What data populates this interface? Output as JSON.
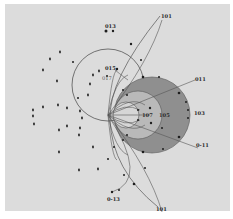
{
  "figure": {
    "type": "stereographic-projection",
    "colors": {
      "paper": "#dcdcdc",
      "border": "#ffffff",
      "shaded_disk": "#8f8f8f",
      "inner_zone": "#b9b9b9",
      "innermost_zone": "#d6d6d6",
      "lines": "#555555",
      "poles": "#1e1e1e"
    },
    "labels": {
      "l101_top": "101",
      "l013": "013",
      "l015": "015",
      "l017": "017",
      "l011": "011",
      "l103": "103",
      "l107": "107",
      "l105": "105",
      "l0m11": "0-11",
      "l0m13": "0-13",
      "l101_bottom": "101"
    },
    "shaded_disk": {
      "cx": 152,
      "cy": 115,
      "r": 38
    },
    "outer_circle": {
      "cx": 108,
      "cy": 85,
      "r": 36
    },
    "scatter_poles": [
      [
        60,
        52
      ],
      [
        50,
        59
      ],
      [
        43,
        70
      ],
      [
        57,
        81
      ],
      [
        43,
        107
      ],
      [
        33,
        110
      ],
      [
        33,
        116
      ],
      [
        34,
        124
      ],
      [
        58,
        105
      ],
      [
        67,
        108
      ],
      [
        80,
        111
      ],
      [
        59,
        130
      ],
      [
        67,
        126
      ],
      [
        79,
        135
      ],
      [
        59,
        152
      ],
      [
        93,
        147
      ],
      [
        79,
        170
      ],
      [
        98,
        169
      ],
      [
        93,
        75
      ],
      [
        99,
        71
      ],
      [
        90,
        84
      ],
      [
        88,
        95
      ],
      [
        82,
        118
      ],
      [
        80,
        128
      ]
    ]
  }
}
